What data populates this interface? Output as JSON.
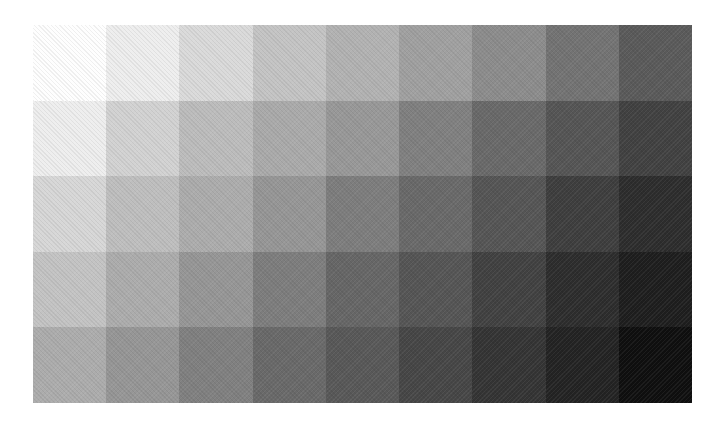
{
  "chart_data": {
    "type": "heatmap",
    "title": "",
    "xlabel": "",
    "ylabel": "",
    "rows": 5,
    "cols": 9,
    "value_meaning": "gray level 0 (black) - 255 (white)",
    "values": [
      [
        254,
        238,
        218,
        196,
        178,
        160,
        140,
        115,
        90
      ],
      [
        238,
        210,
        188,
        170,
        152,
        128,
        105,
        85,
        65
      ],
      [
        215,
        190,
        172,
        150,
        125,
        105,
        85,
        62,
        45
      ],
      [
        195,
        172,
        150,
        125,
        102,
        85,
        65,
        45,
        30
      ],
      [
        172,
        150,
        128,
        105,
        88,
        70,
        52,
        35,
        15
      ]
    ],
    "grid": false,
    "legend": null
  },
  "colors": {
    "background": "#ffffff"
  }
}
